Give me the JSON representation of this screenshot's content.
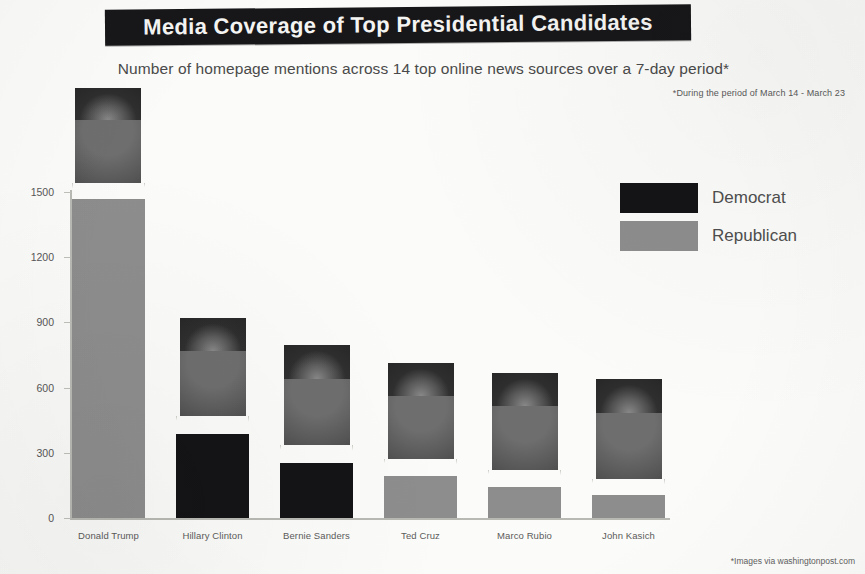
{
  "header": {
    "title": "Media Coverage of Top Presidential Candidates",
    "subtitle": "Number of homepage mentions across 14 top online news sources over a 7-day period*",
    "period_footnote": "*During the period of March 14 - March 23",
    "image_credit": "*Images via washingtonpost.com"
  },
  "legend": {
    "items": [
      {
        "label": "Democrat",
        "color": "#141417"
      },
      {
        "label": "Republican",
        "color": "#8d8d8d"
      }
    ]
  },
  "chart_data": {
    "type": "bar",
    "title": "Media Coverage of Top Presidential Candidates",
    "subtitle": "Number of homepage mentions across 14 top online news sources over a 7-day period*",
    "xlabel": "",
    "ylabel": "",
    "ylim": [
      0,
      1500
    ],
    "yticks": [
      0,
      300,
      600,
      900,
      1200,
      1500
    ],
    "ytick_labels": [
      "0",
      "300",
      "600",
      "900",
      "1200",
      "1500"
    ],
    "grid": false,
    "legend_position": "right",
    "categories": [
      "Donald Trump",
      "Hillary Clinton",
      "Bernie Sanders",
      "Ted Cruz",
      "Marco Rubio",
      "John Kasich"
    ],
    "values": [
      1470,
      385,
      255,
      195,
      145,
      105
    ],
    "party": [
      "Republican",
      "Democrat",
      "Democrat",
      "Republican",
      "Republican",
      "Republican"
    ],
    "colors": [
      "#8d8d8d",
      "#141417",
      "#141417",
      "#8d8d8d",
      "#8d8d8d",
      "#8d8d8d"
    ],
    "annotations": [
      "*During the period of March 14 - March 23",
      "*Images via washingtonpost.com"
    ]
  },
  "bars": [
    {
      "name": "Donald Trump",
      "value": 1470,
      "party": "Republican",
      "color": "#8d8d8d",
      "x": 72,
      "width": 73,
      "photo_top": 88,
      "photo_height": 95,
      "photo_x": 75
    },
    {
      "name": "Hillary Clinton",
      "value": 385,
      "party": "Democrat",
      "color": "#141417",
      "x": 176,
      "width": 73,
      "photo_top": 318,
      "photo_height": 98,
      "photo_x": 180
    },
    {
      "name": "Bernie Sanders",
      "value": 255,
      "party": "Democrat",
      "color": "#141417",
      "x": 280,
      "width": 73,
      "photo_top": 345,
      "photo_height": 100,
      "photo_x": 284
    },
    {
      "name": "Ted Cruz",
      "value": 195,
      "party": "Republican",
      "color": "#8d8d8d",
      "x": 384,
      "width": 73,
      "photo_top": 363,
      "photo_height": 96,
      "photo_x": 388
    },
    {
      "name": "Marco Rubio",
      "value": 145,
      "party": "Republican",
      "color": "#8d8d8d",
      "x": 488,
      "width": 73,
      "photo_top": 373,
      "photo_height": 97,
      "photo_x": 492
    },
    {
      "name": "John Kasich",
      "value": 105,
      "party": "Republican",
      "color": "#8d8d8d",
      "x": 592,
      "width": 73,
      "photo_top": 379,
      "photo_height": 100,
      "photo_x": 596
    }
  ],
  "axis": {
    "ticks": [
      {
        "label": "1500",
        "value": 1500
      },
      {
        "label": "1200",
        "value": 1200
      },
      {
        "label": "900",
        "value": 900
      },
      {
        "label": "600",
        "value": 600
      },
      {
        "label": "300",
        "value": 300
      },
      {
        "label": "0",
        "value": 0
      }
    ]
  }
}
